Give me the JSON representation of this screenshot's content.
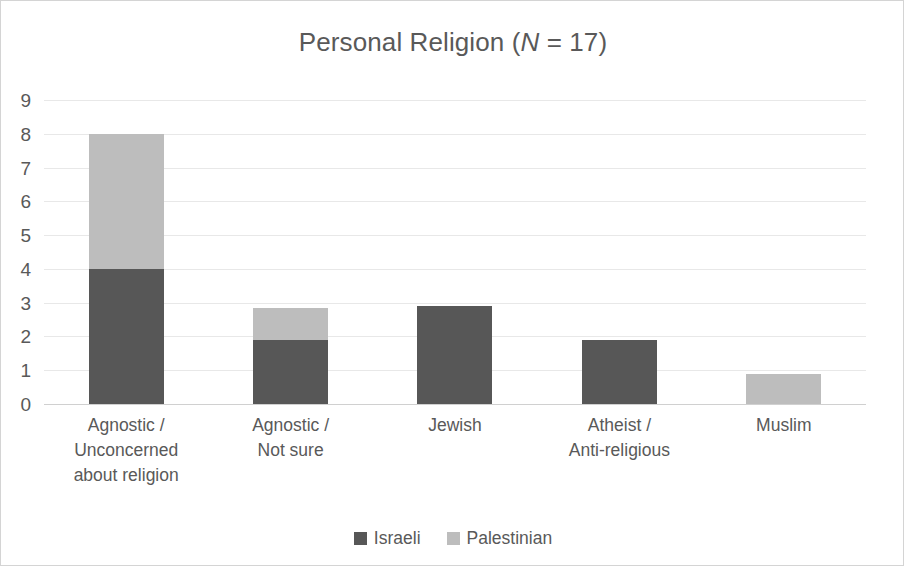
{
  "chart_data": {
    "type": "bar",
    "subtype": "stacked-vertical",
    "title": "Personal Religion (N = 17)",
    "title_parts": {
      "lead": "Personal Religion (",
      "italic": "N",
      "tail": " = 17)"
    },
    "xlabel": "",
    "ylabel": "",
    "ylim": [
      0,
      9
    ],
    "ytick_step": 1,
    "yticks": [
      "9",
      "8",
      "7",
      "6",
      "5",
      "4",
      "3",
      "2",
      "1",
      "0"
    ],
    "grid": true,
    "grid_axis": "y",
    "legend_position": "bottom",
    "categories": [
      "Agnostic / Unconcerned about religion",
      "Agnostic / Not sure",
      "Jewish",
      "Atheist / Anti-religious",
      "Muslim"
    ],
    "category_lines": [
      [
        "Agnostic /",
        "Unconcerned",
        "about religion"
      ],
      [
        "Agnostic /",
        "Not sure"
      ],
      [
        "Jewish"
      ],
      [
        "Atheist /",
        "Anti-religious"
      ],
      [
        "Muslim"
      ]
    ],
    "series": [
      {
        "name": "Israeli",
        "color": "#575757",
        "values": [
          4,
          1.9,
          2.9,
          1.9,
          0
        ]
      },
      {
        "name": "Palestinian",
        "color": "#bdbdbd",
        "values": [
          4,
          0.95,
          0,
          0,
          0.9
        ]
      }
    ],
    "totals": [
      8,
      2.85,
      2.9,
      1.9,
      0.9
    ]
  },
  "legend": {
    "entries": [
      {
        "label": "Israeli",
        "color": "#575757"
      },
      {
        "label": "Palestinian",
        "color": "#bdbdbd"
      }
    ]
  },
  "colors": {
    "israeli": "#575757",
    "palestinian": "#bdbdbd",
    "text": "#595959",
    "gridline": "#e8e8e8",
    "axis": "#d0d0d0",
    "background": "#ffffff",
    "border": "#d4d4d4"
  }
}
